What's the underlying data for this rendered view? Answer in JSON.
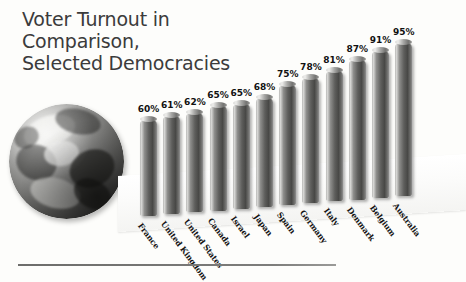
{
  "chart_data": {
    "type": "bar",
    "title": "Voter Turnout in\nComparison,\nSelected Democracies",
    "xlabel": "",
    "ylabel": "",
    "ylim": [
      0,
      100
    ],
    "grid": false,
    "legend": "none",
    "value_suffix": "%",
    "categories": [
      "France",
      "United Kingdom",
      "United States",
      "Canada",
      "Israel",
      "Japan",
      "Spain",
      "Germany",
      "Italy",
      "Denmark",
      "Belgium",
      "Australia"
    ],
    "values": [
      60,
      61,
      62,
      65,
      65,
      68,
      75,
      78,
      81,
      87,
      91,
      95
    ],
    "value_labels": [
      "60%",
      "61%",
      "62%",
      "65%",
      "65%",
      "68%",
      "75%",
      "78%",
      "81%",
      "87%",
      "91%",
      "95%"
    ],
    "bars": [
      {
        "label": "France",
        "value": 60,
        "value_label": "60%"
      },
      {
        "label": "United Kingdom",
        "value": 61,
        "value_label": "61%"
      },
      {
        "label": "United States",
        "value": 62,
        "value_label": "62%"
      },
      {
        "label": "Canada",
        "value": 65,
        "value_label": "65%"
      },
      {
        "label": "Israel",
        "value": 65,
        "value_label": "65%"
      },
      {
        "label": "Japan",
        "value": 68,
        "value_label": "68%"
      },
      {
        "label": "Spain",
        "value": 75,
        "value_label": "75%"
      },
      {
        "label": "Germany",
        "value": 78,
        "value_label": "78%"
      },
      {
        "label": "Italy",
        "value": 81,
        "value_label": "81%"
      },
      {
        "label": "Denmark",
        "value": 87,
        "value_label": "87%"
      },
      {
        "label": "Belgium",
        "value": 91,
        "value_label": "91%"
      },
      {
        "label": "Australia",
        "value": 95,
        "value_label": "95%"
      }
    ]
  },
  "decoration": {
    "globe_icon": "earth-globe-icon"
  },
  "colors": {
    "title_text": "#3b3b3b",
    "value_text": "#111111",
    "label_text": "#141414",
    "bar_dark": "#484846",
    "bar_light": "#d6d6d4",
    "background": "#fdfdfb",
    "rule": "#6d6d6b"
  }
}
